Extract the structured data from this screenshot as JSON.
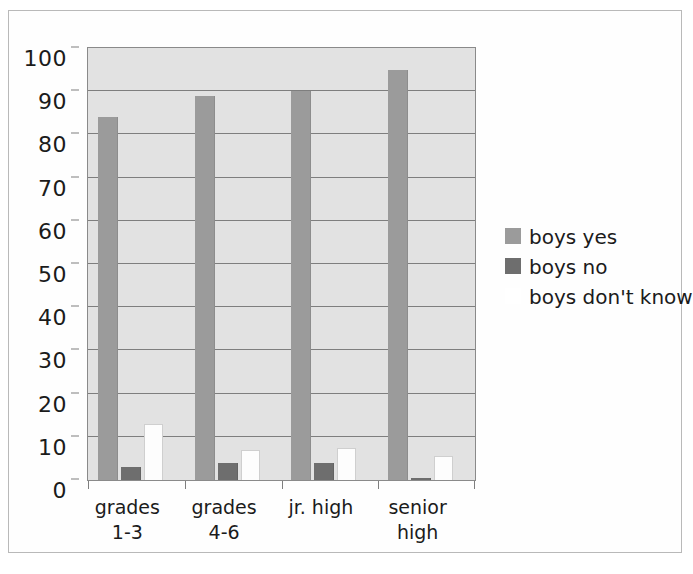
{
  "chart_data": {
    "type": "bar",
    "title": "",
    "xlabel": "",
    "ylabel": "",
    "ylim": [
      0,
      100
    ],
    "ytick_step": 10,
    "yticks": [
      "0",
      "10",
      "20",
      "30",
      "40",
      "50",
      "60",
      "70",
      "80",
      "90",
      "100"
    ],
    "grid": true,
    "legend_position": "right",
    "categories": [
      "grades 1-3",
      "grades 4-6",
      "jr. high",
      "senior high"
    ],
    "category_lines": [
      {
        "line1": "grades",
        "line2": "1-3"
      },
      {
        "line1": "grades",
        "line2": "4-6"
      },
      {
        "line1": "jr. high",
        "line2": ""
      },
      {
        "line1": "senior",
        "line2": "high"
      }
    ],
    "series": [
      {
        "name": "boys yes",
        "color": "#9b9b9b",
        "values": [
          84,
          89,
          90,
          95
        ]
      },
      {
        "name": "boys no",
        "color": "#6e6e6e",
        "values": [
          3,
          4,
          4,
          0.5
        ]
      },
      {
        "name": "boys don't know",
        "color": "#ffffff",
        "values": [
          13,
          7,
          7.5,
          5.5
        ]
      }
    ]
  },
  "legend": {
    "items": [
      {
        "label": "boys yes",
        "swatch": "legend-swatch-boys-yes"
      },
      {
        "label": "boys no",
        "swatch": "legend-swatch-boys-no"
      },
      {
        "label": "boys don't know",
        "swatch": "legend-swatch-boys-dont-know"
      }
    ]
  },
  "colors": {
    "plot_background": "#e2e2e2",
    "gridline": "#7e7e7e",
    "axis": "#8a8a8a",
    "frame_border": "#b9b9b9",
    "page_background": "#ffffff",
    "text": "#1b1b1b"
  }
}
